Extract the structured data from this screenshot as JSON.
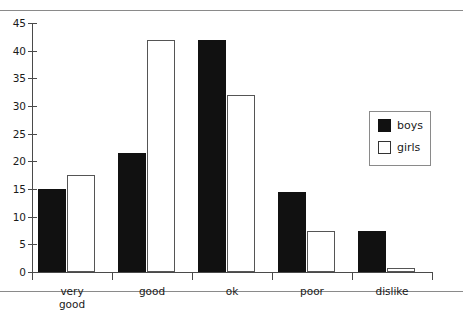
{
  "chart_data": {
    "type": "bar",
    "title": "",
    "xlabel": "",
    "ylabel": "",
    "categories": [
      "very\ngood",
      "good",
      "ok",
      "poor",
      "dislike"
    ],
    "series": [
      {
        "name": "boys",
        "color": "#111111",
        "values": [
          15,
          21.5,
          42,
          14.5,
          7.5
        ]
      },
      {
        "name": "girls",
        "color": "#ffffff",
        "values": [
          17.5,
          42,
          32,
          7.5,
          0.7
        ]
      }
    ],
    "ylim": [
      0,
      45
    ],
    "yticks": [
      0,
      5,
      10,
      15,
      20,
      25,
      30,
      35,
      40,
      45
    ],
    "ytick_labels": [
      "0",
      "5",
      "10",
      "15",
      "20",
      "25",
      "30",
      "35",
      "40",
      "45"
    ],
    "grid": false,
    "legend_position": "right",
    "legend": [
      "boys",
      "girls"
    ]
  },
  "legend": {
    "boys_label": "boys",
    "girls_label": "girls"
  }
}
